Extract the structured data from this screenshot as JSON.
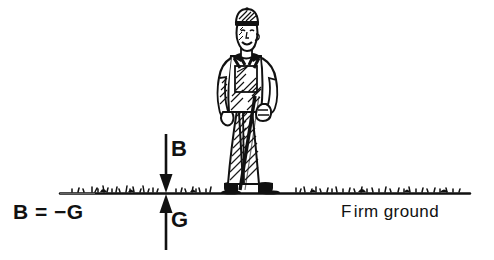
{
  "diagram": {
    "type": "free-body-force-diagram",
    "background_color": "#ffffff",
    "ink_color": "#111111"
  },
  "labels": {
    "force_down": "B",
    "force_up": "G",
    "equation": "B = −G",
    "ground": "Firm ground",
    "ground_first_letter": "F",
    "ground_rest": "irm ground"
  },
  "arrows": [
    {
      "name": "arrow-b",
      "label": "B",
      "direction": "down",
      "x": 166,
      "y_start": 134,
      "y_end": 192,
      "meaning": "force exerted by body on ground"
    },
    {
      "name": "arrow-g",
      "label": "G",
      "direction": "up",
      "x": 166,
      "y_start": 250,
      "y_end": 194,
      "meaning": "reaction force of ground on body"
    }
  ],
  "ground_line": {
    "name": "ground-line",
    "y": 193,
    "x_start": 60,
    "x_end": 470,
    "texture": "grass-tufts"
  },
  "person": {
    "name": "standing-worker",
    "description": "worker in cap and overalls holding a long-handled tool",
    "x": 216,
    "y": 8,
    "width": 76,
    "height": 186
  }
}
